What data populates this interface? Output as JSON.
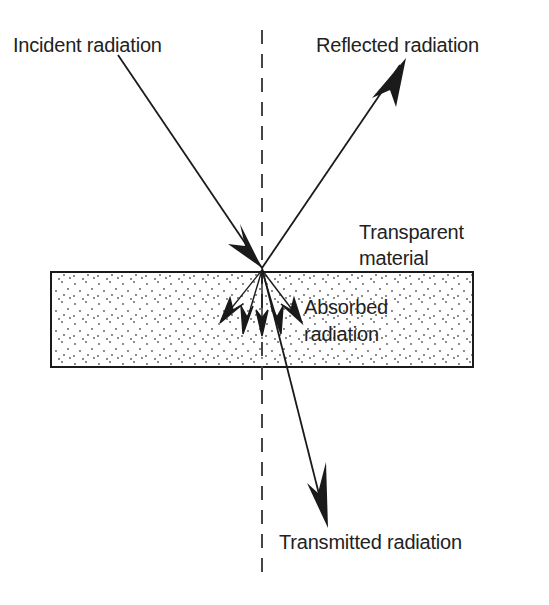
{
  "diagram": {
    "labels": {
      "incident": "Incident radiation",
      "reflected": "Reflected radiation",
      "material_line1": "Transparent",
      "material_line2": "material",
      "absorbed_line1": "Absorbed",
      "absorbed_line2": "radiation",
      "transmitted": "Transmitted radiation"
    },
    "colors": {
      "line": "#1a1a1a",
      "text": "#222222",
      "background": "#ffffff",
      "dots": "#555555"
    }
  }
}
